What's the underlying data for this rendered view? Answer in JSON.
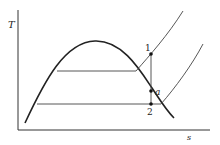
{
  "diagram": {
    "axes": {
      "y_label": "T",
      "x_label": "s"
    },
    "points": [
      {
        "label": "1",
        "x": 151,
        "y": 54
      },
      {
        "label": "a",
        "x": 151,
        "y": 91
      },
      {
        "label": "2",
        "x": 151,
        "y": 104
      }
    ],
    "colors": {
      "line": "#222222",
      "background": "#ffffff"
    }
  }
}
